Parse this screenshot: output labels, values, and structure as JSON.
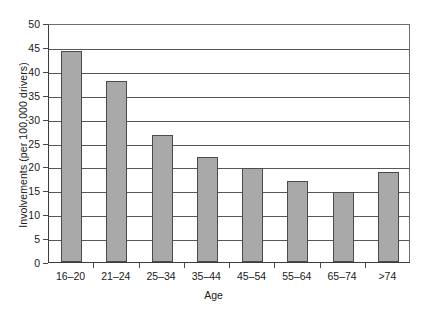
{
  "chart_data": {
    "type": "bar",
    "title": "",
    "subtitle": "",
    "xlabel": "Age",
    "ylabel": "Involvements (per 100,000 drivers)",
    "categories": [
      "16–20",
      "21–24",
      "25–34",
      "35–44",
      "45–54",
      "55–64",
      "65–74",
      ">74"
    ],
    "values": [
      44.2,
      37.9,
      26.6,
      22.0,
      19.6,
      16.9,
      14.6,
      18.8
    ],
    "ylim": [
      0,
      50
    ],
    "ytick_labels": [
      "50",
      "45",
      "40",
      "35",
      "30",
      "25",
      "20",
      "15",
      "10",
      "5",
      "0"
    ],
    "ytick_values": [
      50,
      45,
      40,
      35,
      30,
      25,
      20,
      15,
      10,
      5,
      0
    ],
    "ytick_step": 5,
    "grid": "horizontal",
    "legend": "none",
    "series": [
      {
        "name": "Involvements",
        "color": "#a9a9a9",
        "edge_color": "#4b4b4b",
        "values": [
          44.2,
          37.9,
          26.6,
          22.0,
          19.6,
          16.9,
          14.6,
          18.8
        ]
      }
    ],
    "annotations": []
  },
  "colors": {
    "bar_fill": "#a9a9a9",
    "bar_edge": "#4b4b4b",
    "gridline": "#575757",
    "axis": "#3c3c3c",
    "background": "#ffffff",
    "text": "#202020"
  }
}
